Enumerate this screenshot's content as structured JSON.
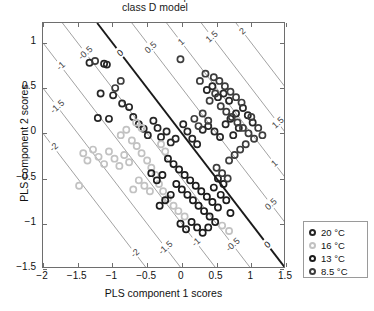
{
  "title": {
    "line1": "PLS-DA scores plot",
    "line2": "class D model"
  },
  "axes": {
    "xlabel": "PLS component 1 scores",
    "ylabel": "PLS component 2 scores",
    "xticks": [
      "-2",
      "-1.5",
      "-1",
      "-0.5",
      "0",
      "0.5",
      "1",
      "1.5"
    ],
    "yticks": [
      "1",
      "0.5",
      "0",
      "-0.5",
      "-1",
      "-1.5"
    ]
  },
  "legend": {
    "items": [
      {
        "label": "20 °C",
        "color": "#262626"
      },
      {
        "label": "16 °C",
        "color": "#c2c2c2"
      },
      {
        "label": "13 °C",
        "color": "#1c1c1c"
      },
      {
        "label": "8.5 °C",
        "color": "#3d3d3d"
      }
    ]
  },
  "chart_data": {
    "type": "scatter",
    "title": "PLS-DA scores plot class D model",
    "xlabel": "PLS component 1 scores",
    "ylabel": "PLS component 2 scores",
    "xlim": [
      -2.0,
      1.5
    ],
    "ylim": [
      -1.5,
      1.22
    ],
    "xticks": [
      -2,
      -1.5,
      -1,
      -0.5,
      0,
      0.5,
      1,
      1.5
    ],
    "yticks": [
      1,
      0.5,
      0,
      -0.5,
      -1,
      -1.5
    ],
    "grid": false,
    "legend_position": "outside-bottom-right",
    "contours": {
      "description": "Diagonal iso-prediction lines of slope -1; value = x + y",
      "levels": [
        -2,
        -1.5,
        -1,
        -0.5,
        0,
        0.5,
        1,
        1.5,
        2
      ],
      "bold_level": 0,
      "color": "#8a8a8a",
      "bold_color": "#1a1a1a",
      "labels": [
        "-2",
        "-1.5",
        "-1",
        "-0.5",
        "0",
        "0.5",
        "1",
        "1.5",
        "2"
      ]
    },
    "series": [
      {
        "name": "20 °C",
        "color": "#262626",
        "marker": "o",
        "points": [
          [
            -1.33,
            0.78
          ],
          [
            -1.12,
            0.77
          ],
          [
            -1.08,
            0.76
          ],
          [
            -1.17,
            0.44
          ],
          [
            -0.99,
            0.42
          ],
          [
            -1.21,
            0.17
          ],
          [
            -1.05,
            0.16
          ],
          [
            -0.86,
            0.33
          ],
          [
            -0.76,
            0.29
          ],
          [
            -0.7,
            0.18
          ],
          [
            -0.62,
            0.1
          ],
          [
            -0.55,
            0.05
          ],
          [
            -0.49,
            -0.02
          ],
          [
            -0.41,
            0.14
          ],
          [
            -0.35,
            0.06
          ],
          [
            -0.3,
            -0.04
          ],
          [
            -0.22,
            0.02
          ],
          [
            -0.16,
            -0.1
          ],
          [
            -0.09,
            -0.06
          ],
          [
            0.02,
            0.1
          ],
          [
            0.08,
            0.02
          ],
          [
            0.15,
            -0.06
          ],
          [
            0.22,
            -0.12
          ],
          [
            0.3,
            0.04
          ],
          [
            0.38,
            0.08
          ],
          [
            0.47,
            0.02
          ],
          [
            0.55,
            -0.04
          ],
          [
            0.63,
            0.1
          ],
          [
            0.7,
            0.16
          ],
          [
            0.78,
            0.22
          ],
          [
            0.52,
            0.4
          ],
          [
            0.6,
            0.44
          ],
          [
            0.68,
            0.36
          ],
          [
            0.44,
            0.52
          ],
          [
            0.36,
            0.48
          ],
          [
            0.88,
            0.28
          ],
          [
            0.95,
            0.2
          ],
          [
            1.02,
            0.12
          ],
          [
            0.82,
            0.06
          ],
          [
            0.74,
            -0.02
          ]
        ]
      },
      {
        "name": "16 °C",
        "color": "#c2c2c2",
        "marker": "o",
        "points": [
          [
            -1.42,
            -0.22
          ],
          [
            -1.36,
            -0.3
          ],
          [
            -1.28,
            -0.18
          ],
          [
            -1.2,
            -0.26
          ],
          [
            -1.12,
            -0.34
          ],
          [
            -1.05,
            -0.2
          ],
          [
            -0.97,
            -0.28
          ],
          [
            -0.9,
            -0.36
          ],
          [
            -0.83,
            -0.24
          ],
          [
            -0.76,
            -0.32
          ],
          [
            -0.88,
            -0.02
          ],
          [
            -0.8,
            0.04
          ],
          [
            -0.72,
            -0.08
          ],
          [
            -0.65,
            -0.14
          ],
          [
            -0.58,
            -0.22
          ],
          [
            -0.5,
            -0.3
          ],
          [
            -0.44,
            -0.38
          ],
          [
            -0.38,
            -0.46
          ],
          [
            -0.62,
            -0.52
          ],
          [
            -0.54,
            -0.58
          ],
          [
            -0.46,
            -0.64
          ],
          [
            -0.7,
            -0.62
          ],
          [
            -0.33,
            -0.56
          ],
          [
            -0.27,
            -0.64
          ],
          [
            -0.2,
            -0.72
          ],
          [
            -0.12,
            -0.8
          ],
          [
            -0.05,
            -0.86
          ],
          [
            0.04,
            -0.92
          ],
          [
            -0.66,
            0.12
          ],
          [
            -0.58,
            0.06
          ],
          [
            -0.3,
            -0.12
          ],
          [
            -0.24,
            -0.2
          ],
          [
            -1.48,
            -0.58
          ],
          [
            0.58,
            -1.02
          ],
          [
            0.68,
            -1.08
          ]
        ]
      },
      {
        "name": "13 °C",
        "color": "#1c1c1c",
        "marker": "o",
        "points": [
          [
            -0.2,
            -0.28
          ],
          [
            -0.12,
            -0.34
          ],
          [
            -0.04,
            -0.4
          ],
          [
            0.04,
            -0.46
          ],
          [
            0.12,
            -0.52
          ],
          [
            0.2,
            -0.58
          ],
          [
            0.28,
            -0.64
          ],
          [
            0.36,
            -0.7
          ],
          [
            0.44,
            -0.76
          ],
          [
            0.52,
            -0.82
          ],
          [
            -0.08,
            -0.56
          ],
          [
            0.0,
            -0.62
          ],
          [
            0.08,
            -0.68
          ],
          [
            0.16,
            -0.74
          ],
          [
            0.24,
            -0.8
          ],
          [
            0.32,
            -0.86
          ],
          [
            0.4,
            -0.92
          ],
          [
            0.48,
            -0.98
          ],
          [
            0.14,
            -0.98
          ],
          [
            0.22,
            -1.04
          ],
          [
            0.06,
            -1.06
          ],
          [
            -0.02,
            -1.0
          ],
          [
            0.3,
            -1.1
          ],
          [
            0.38,
            -1.04
          ],
          [
            -0.28,
            -0.46
          ],
          [
            -0.36,
            -0.52
          ],
          [
            -0.44,
            -0.44
          ],
          [
            0.56,
            -0.68
          ],
          [
            0.64,
            -0.74
          ],
          [
            0.6,
            -0.56
          ],
          [
            0.52,
            -0.5
          ],
          [
            0.46,
            -0.6
          ],
          [
            -0.16,
            -0.68
          ],
          [
            -0.24,
            -0.74
          ],
          [
            -0.32,
            -0.8
          ],
          [
            0.7,
            -0.88
          ]
        ]
      },
      {
        "name": "8.5 °C",
        "color": "#3d3d3d",
        "marker": "o",
        "points": [
          [
            0.46,
            0.62
          ],
          [
            0.54,
            0.58
          ],
          [
            0.62,
            0.52
          ],
          [
            0.7,
            0.46
          ],
          [
            0.78,
            0.4
          ],
          [
            0.86,
            0.34
          ],
          [
            0.56,
            0.3
          ],
          [
            0.64,
            0.24
          ],
          [
            0.72,
            0.18
          ],
          [
            0.8,
            0.12
          ],
          [
            0.88,
            0.06
          ],
          [
            0.96,
            0.0
          ],
          [
            1.04,
            -0.06
          ],
          [
            0.92,
            -0.12
          ],
          [
            0.84,
            -0.18
          ],
          [
            0.76,
            -0.24
          ],
          [
            0.68,
            -0.3
          ],
          [
            0.4,
            0.36
          ],
          [
            0.48,
            0.44
          ],
          [
            0.34,
            0.66
          ],
          [
            0.26,
            0.58
          ],
          [
            1.1,
            0.06
          ],
          [
            1.16,
            -0.02
          ],
          [
            1.0,
            0.18
          ],
          [
            0.3,
            0.22
          ],
          [
            0.38,
            0.14
          ],
          [
            0.24,
            0.08
          ],
          [
            0.18,
            0.16
          ],
          [
            -0.02,
            0.82
          ],
          [
            0.5,
            -0.38
          ],
          [
            0.58,
            -0.44
          ],
          [
            0.66,
            -0.5
          ],
          [
            -1.25,
            0.8
          ],
          [
            -0.88,
            0.58
          ],
          [
            -0.96,
            0.5
          ]
        ]
      }
    ]
  }
}
